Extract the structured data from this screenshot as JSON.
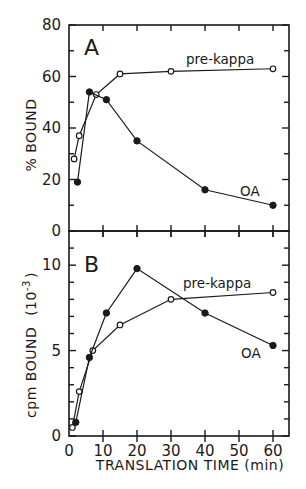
{
  "chart_data": [
    {
      "type": "line",
      "panel": "A",
      "title": "",
      "xlabel": "",
      "ylabel": "% BOUND",
      "xlim": [
        0,
        65
      ],
      "ylim": [
        0,
        80
      ],
      "yticks": [
        0,
        20,
        40,
        60,
        80
      ],
      "yminor_step": 10,
      "xticks": [
        10,
        20,
        30,
        40,
        50,
        60
      ],
      "grid": false,
      "series": [
        {
          "name": "pre-kappa",
          "marker": "open-circle",
          "x": [
            1.5,
            3,
            8,
            15,
            30,
            60
          ],
          "values": [
            28,
            37,
            53,
            61,
            62,
            63
          ]
        },
        {
          "name": "OA",
          "marker": "filled-circle",
          "x": [
            2.5,
            6,
            11,
            20,
            40,
            60
          ],
          "values": [
            19,
            54,
            51,
            35,
            16,
            10
          ]
        }
      ]
    },
    {
      "type": "line",
      "panel": "B",
      "title": "",
      "xlabel": "TRANSLATION TIME (min)",
      "ylabel": "cpm BOUND (10⁻³)",
      "xlim": [
        0,
        65
      ],
      "ylim": [
        0,
        12
      ],
      "yticks": [
        0,
        5,
        10
      ],
      "yminor_step": 1,
      "xticks": [
        0,
        10,
        20,
        30,
        40,
        50,
        60
      ],
      "grid": false,
      "series": [
        {
          "name": "pre-kappa",
          "marker": "open-circle",
          "x": [
            1,
            3,
            7,
            15,
            30,
            60
          ],
          "values": [
            0.5,
            2.6,
            5.0,
            6.5,
            8.0,
            8.4
          ]
        },
        {
          "name": "OA",
          "marker": "filled-circle",
          "x": [
            2,
            6,
            11,
            20,
            40,
            60
          ],
          "values": [
            0.8,
            4.6,
            7.2,
            9.8,
            7.2,
            5.3
          ]
        }
      ]
    }
  ],
  "figure": {
    "panel_a": {
      "label": "A",
      "ylabel": "% BOUND",
      "series_label_prekappa": "pre-kappa",
      "series_label_oa": "OA"
    },
    "panel_b": {
      "label": "B",
      "ylabel_main": "cpm BOUND",
      "ylabel_unit": "(10",
      "ylabel_exp": "-3",
      "ylabel_close": ")",
      "series_label_prekappa": "pre-kappa",
      "series_label_oa": "OA"
    },
    "xlabel": "TRANSLATION TIME (min)"
  }
}
